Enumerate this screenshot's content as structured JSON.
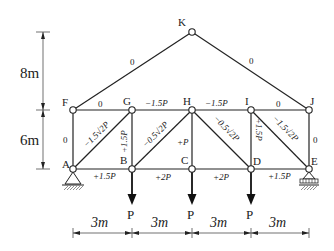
{
  "nodes": {
    "K": {
      "label": "K",
      "x": 192,
      "y": 32
    },
    "F": {
      "label": "F",
      "x": 73,
      "y": 110
    },
    "G": {
      "label": "G",
      "x": 132,
      "y": 110
    },
    "H": {
      "label": "H",
      "x": 192,
      "y": 110
    },
    "I": {
      "label": "I",
      "x": 251,
      "y": 110
    },
    "J": {
      "label": "J",
      "x": 309,
      "y": 110
    },
    "A": {
      "label": "A",
      "x": 73,
      "y": 169
    },
    "B": {
      "label": "B",
      "x": 132,
      "y": 169
    },
    "C": {
      "label": "C",
      "x": 192,
      "y": 169
    },
    "D": {
      "label": "D",
      "x": 251,
      "y": 169
    },
    "E": {
      "label": "E",
      "x": 309,
      "y": 169
    }
  },
  "members": {
    "FK": "0",
    "KJ": "0",
    "FG": "0",
    "GH": "−1.5P",
    "HI": "−1.5P",
    "IJ": "0",
    "AF": "0",
    "AG": "−1.5√2P",
    "BG": "+1.5P",
    "BH": "−0.5√2P",
    "CH": "+P",
    "DH": "−0.5√2P",
    "DI": "+1.5P",
    "EI": "−1.5√2P",
    "EJ": "0",
    "AB": "+1.5P",
    "BC": "+2P",
    "CD": "+2P",
    "DE": "+1.5P"
  },
  "loads": {
    "B": "P",
    "C": "P",
    "D": "P"
  },
  "dimensions": {
    "vertical_top": "8m",
    "vertical_bottom": "6m",
    "span1": "3m",
    "span2": "3m",
    "span3": "3m",
    "span4": "3m"
  },
  "supports": {
    "A": "pin",
    "E": "roller"
  }
}
